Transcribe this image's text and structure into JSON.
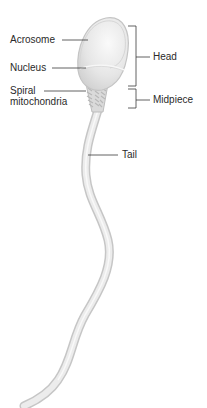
{
  "diagram": {
    "labels": {
      "acrosome": "Acrosome",
      "nucleus": "Nucleus",
      "spiral_line1": "Spiral",
      "spiral_line2": "mitochondria",
      "head": "Head",
      "midpiece": "Midpiece",
      "tail": "Tail"
    },
    "colors": {
      "background": "#ffffff",
      "cell_fill": "#e9e9e9",
      "cell_outline": "#c8c8c8",
      "leader_lines": "#3a3a3a",
      "text": "#2a2a2a"
    }
  }
}
